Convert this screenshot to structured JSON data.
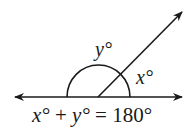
{
  "diagram": {
    "type": "supplementary-angles",
    "angle_y_label": "y°",
    "angle_x_label": "x°",
    "equation": {
      "x_term": "x°",
      "plus": " + ",
      "y_term": "y°",
      "equals": " = ",
      "total": "180°"
    },
    "colors": {
      "stroke": "#1a1a1a",
      "background": "#ffffff"
    }
  }
}
